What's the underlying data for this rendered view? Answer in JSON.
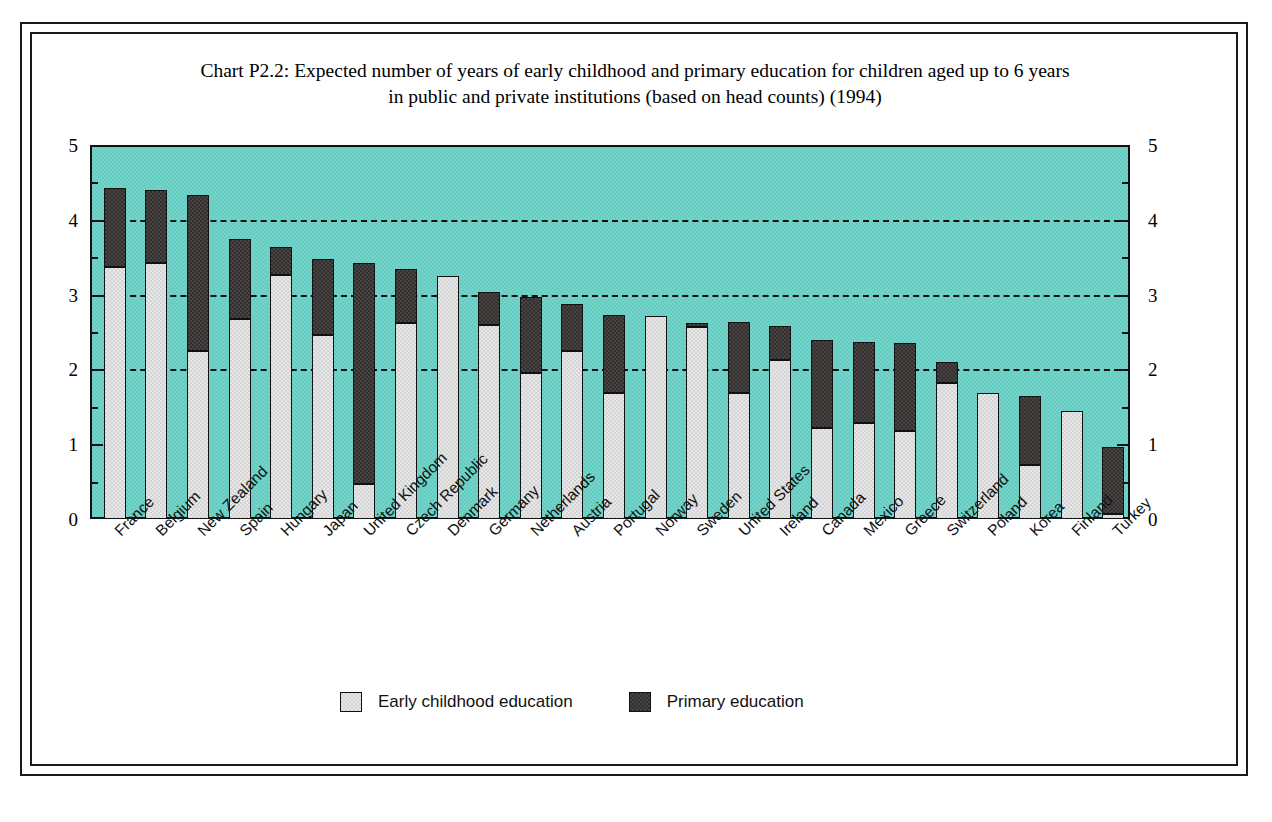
{
  "chart_data": {
    "type": "bar",
    "subtype": "stacked-vertical",
    "title": "Chart P2.2: Expected number of years of early childhood and primary education for children aged up to 6 years in public and private institutions (based on head counts) (1994)",
    "title_line1": "Chart P2.2: Expected number of years of early childhood and primary education for children aged up to 6 years",
    "title_line2": "in public and private institutions (based on head counts) (1994)",
    "xlabel": "",
    "ylabel": "",
    "ylim": [
      0,
      5
    ],
    "ytick_values": [
      0,
      1,
      2,
      3,
      4,
      5
    ],
    "ytick_labels": [
      "0",
      "1",
      "2",
      "3",
      "4",
      "5"
    ],
    "yminor_step": 0.5,
    "grid": "horizontal dashed at 1, 2, 3, 4",
    "gridline_values": [
      1,
      2,
      3,
      4
    ],
    "dual_y_axis": true,
    "legend_position": "bottom-center",
    "plot_background": "#63cdc1",
    "categories": [
      "France",
      "Belgium",
      "New Zealand",
      "Spain",
      "Hungary",
      "Japan",
      "United Kingdom",
      "Czech Republic",
      "Denmark",
      "Germany",
      "Netherlands",
      "Austria",
      "Portugal",
      "Norway",
      "Sweden",
      "United States",
      "Ireland",
      "Canada",
      "Mexico",
      "Greece",
      "Switzerland",
      "Poland",
      "Korea",
      "Finland",
      "Turkey"
    ],
    "series": [
      {
        "name": "Early childhood education",
        "color": "#d4d4d4",
        "values": [
          3.37,
          3.42,
          2.25,
          2.68,
          3.26,
          2.46,
          0.47,
          2.62,
          3.25,
          2.59,
          1.95,
          2.25,
          1.68,
          2.72,
          2.57,
          1.68,
          2.12,
          1.22,
          1.28,
          1.18,
          1.82,
          1.68,
          0.72,
          1.45,
          0.07
        ]
      },
      {
        "name": "Primary education",
        "color": "#332f2f",
        "values": [
          1.05,
          0.98,
          2.08,
          1.07,
          0.37,
          1.02,
          2.95,
          0.72,
          0.0,
          0.44,
          1.02,
          0.62,
          1.05,
          0.0,
          0.05,
          0.95,
          0.46,
          1.18,
          1.09,
          1.17,
          0.28,
          0.0,
          0.93,
          0.0,
          0.89
        ]
      }
    ],
    "totals": [
      4.42,
      4.4,
      4.33,
      3.75,
      3.63,
      3.48,
      3.42,
      3.34,
      3.25,
      3.03,
      2.97,
      2.87,
      2.73,
      2.72,
      2.62,
      2.63,
      2.58,
      2.4,
      2.37,
      2.35,
      2.1,
      1.68,
      1.65,
      1.45,
      0.96
    ]
  },
  "legend": {
    "entries": [
      {
        "label": "Early childhood education",
        "color": "#d4d4d4"
      },
      {
        "label": "Primary education",
        "color": "#332f2f"
      }
    ]
  }
}
